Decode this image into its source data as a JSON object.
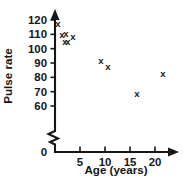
{
  "chart_data": {
    "type": "scatter",
    "title": "",
    "xlabel": "Age (years)",
    "ylabel": "Pulse rate",
    "xlim": [
      0,
      22.5
    ],
    "ylim": [
      55,
      122
    ],
    "grid": false,
    "legend": null,
    "axis_break_y": true,
    "marker": "x",
    "xticks": [
      0,
      5,
      10,
      15,
      20
    ],
    "yticks": [
      60,
      70,
      80,
      90,
      100,
      110,
      120
    ],
    "x": [
      0.6,
      1.4,
      2.2,
      2.0,
      2.6,
      3.6,
      9.2,
      10.6,
      16.4,
      21.6
    ],
    "y": [
      117,
      109,
      110,
      104,
      104,
      108,
      91,
      87,
      68,
      82
    ],
    "points": [
      {
        "x": 0.6,
        "y": 117
      },
      {
        "x": 1.4,
        "y": 109
      },
      {
        "x": 2.2,
        "y": 110
      },
      {
        "x": 2.0,
        "y": 104
      },
      {
        "x": 2.6,
        "y": 104
      },
      {
        "x": 3.6,
        "y": 108
      },
      {
        "x": 9.2,
        "y": 91
      },
      {
        "x": 10.6,
        "y": 87
      },
      {
        "x": 16.4,
        "y": 68
      },
      {
        "x": 21.6,
        "y": 82
      }
    ]
  },
  "axes": {
    "y_tick_labels": [
      "120",
      "110",
      "100",
      "90",
      "80",
      "70",
      "60"
    ],
    "x_tick_labels": [
      "0",
      "5",
      "10",
      "15",
      "20"
    ],
    "y_axis_title": "Pulse rate",
    "x_axis_title": "Age (years)",
    "origin_label": "0"
  },
  "markers": {
    "glyph": "x"
  },
  "colors": {
    "ink": "#161616",
    "background": "#ffffff"
  }
}
